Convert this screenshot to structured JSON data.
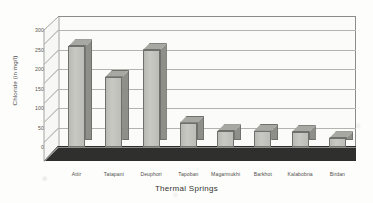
{
  "chart_data": {
    "type": "bar",
    "title": "",
    "xlabel": "Thermal Springs",
    "ylabel": "Chloride (in mg/l)",
    "ylim": [
      0,
      300
    ],
    "yticks": [
      0,
      50,
      100,
      150,
      200,
      250,
      300
    ],
    "grid": true,
    "legend": "none",
    "style": "3d-column",
    "categories": [
      "Attir",
      "Tatapani",
      "Deuphori",
      "Tapoban",
      "Magarmukhi",
      "Barkhot",
      "Kalabobna",
      "Birdan"
    ],
    "values": [
      258,
      180,
      248,
      62,
      40,
      42,
      38,
      22
    ],
    "series": [
      {
        "name": "Chloride",
        "values": [
          258,
          180,
          248,
          62,
          40,
          42,
          38,
          22
        ]
      }
    ]
  },
  "colors": {
    "bar_front": "#c9c9c4",
    "bar_side": "#8f8f8a",
    "bar_top": "#a8a8a3",
    "bar_outline": "#6f6f6b",
    "gridline": "#b4b4ae",
    "axis": "#8d8d88",
    "floor": "#2f2f2d",
    "text": "#4f4f4a",
    "background": "#fdfdfc"
  }
}
